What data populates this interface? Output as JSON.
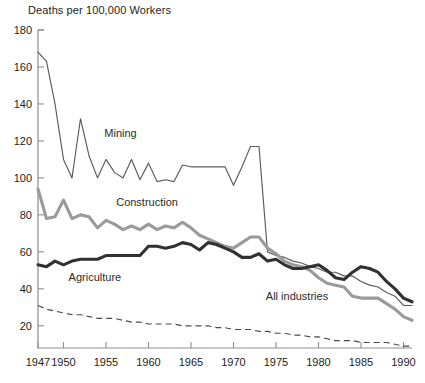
{
  "chart_data": {
    "type": "line",
    "title": "",
    "ylabel": "Deaths per 100,000 Workers",
    "xlabel": "",
    "ylim": [
      8,
      180
    ],
    "xlim": [
      1947,
      1991
    ],
    "grid": false,
    "legend_position": "inline-annotations",
    "ytick_labels": [
      "180",
      "160",
      "140",
      "120",
      "100",
      "80",
      "60",
      "40",
      "20"
    ],
    "ytick_values": [
      180,
      160,
      140,
      120,
      100,
      80,
      60,
      40,
      20
    ],
    "xtick_labels": [
      "1947",
      "1950",
      "1955",
      "1960",
      "1965",
      "1970",
      "1975",
      "1980",
      "1985",
      "1990"
    ],
    "xtick_values": [
      1947,
      1950,
      1955,
      1960,
      1965,
      1970,
      1975,
      1980,
      1985,
      1990
    ],
    "x": [
      1947,
      1948,
      1949,
      1950,
      1951,
      1952,
      1953,
      1954,
      1955,
      1956,
      1957,
      1958,
      1959,
      1960,
      1961,
      1962,
      1963,
      1964,
      1965,
      1966,
      1967,
      1968,
      1969,
      1970,
      1971,
      1972,
      1973,
      1974,
      1975,
      1976,
      1977,
      1978,
      1979,
      1980,
      1981,
      1982,
      1983,
      1984,
      1985,
      1986,
      1987,
      1988,
      1989,
      1990,
      1991
    ],
    "series": [
      {
        "name": "Mining",
        "style": "thin-solid-dark",
        "color": "#5b5b5b",
        "values": [
          168,
          163,
          140,
          110,
          100,
          132,
          112,
          100,
          110,
          103,
          100,
          110,
          99,
          108,
          98,
          99,
          98,
          107,
          106,
          106,
          106,
          106,
          106,
          96,
          106,
          117,
          117,
          60,
          58,
          57,
          55,
          54,
          52,
          51,
          49,
          49,
          47,
          47,
          44,
          42,
          41,
          38,
          36,
          31,
          31
        ]
      },
      {
        "name": "Construction",
        "style": "thick-solid-gray",
        "color": "#9a9a9a",
        "values": [
          94,
          78,
          79,
          88,
          78,
          80,
          79,
          73,
          77,
          75,
          72,
          74,
          72,
          75,
          72,
          74,
          73,
          76,
          73,
          69,
          67,
          65,
          63,
          62,
          65,
          68,
          68,
          62,
          59,
          55,
          53,
          52,
          50,
          46,
          43,
          42,
          41,
          36,
          35,
          35,
          35,
          32,
          29,
          25,
          23
        ]
      },
      {
        "name": "Agriculture",
        "style": "thick-solid-dark",
        "color": "#313131",
        "values": [
          53,
          52,
          55,
          53,
          55,
          56,
          56,
          56,
          58,
          58,
          58,
          58,
          58,
          63,
          63,
          62,
          63,
          65,
          64,
          61,
          65,
          64,
          62,
          60,
          57,
          57,
          59,
          55,
          56,
          53,
          51,
          51,
          52,
          53,
          50,
          46,
          45,
          49,
          52,
          51,
          49,
          44,
          40,
          35,
          33
        ]
      },
      {
        "name": "All industries",
        "style": "dashed-thin",
        "color": "#4a4a4a",
        "values": [
          31,
          29,
          28,
          27,
          26,
          26,
          25,
          24,
          24,
          24,
          23,
          22,
          22,
          21,
          21,
          21,
          21,
          20,
          20,
          20,
          20,
          19,
          19,
          18,
          18,
          18,
          17,
          17,
          16,
          16,
          15,
          15,
          14,
          14,
          13,
          12,
          12,
          12,
          11,
          11,
          11,
          11,
          10,
          9,
          9
        ]
      }
    ],
    "annotations": [
      {
        "name": "mining-label",
        "text": "Mining",
        "x": 1954.8,
        "y": 122
      },
      {
        "name": "construction-label",
        "text": "Construction",
        "x": 1956.2,
        "y": 85
      },
      {
        "name": "agriculture-label",
        "text": "Agriculture",
        "x": 1950.6,
        "y": 44
      },
      {
        "name": "all-industries-label",
        "text": "All industries",
        "x": 1973.8,
        "y": 34
      }
    ]
  }
}
